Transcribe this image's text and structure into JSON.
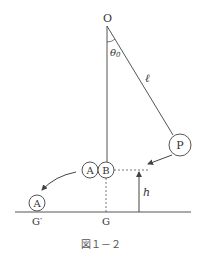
{
  "figure": {
    "caption": "図１－２",
    "colors": {
      "stroke": "#444444",
      "text": "#333333",
      "background": "#ffffff"
    }
  },
  "labels": {
    "pivot": "O",
    "angle": "θ",
    "angle_sub": "0",
    "length": "ℓ",
    "ball_p": "P",
    "ball_a": "A",
    "ball_b": "B",
    "ball_a_landed": "A",
    "height": "h",
    "ground_g": "G",
    "ground_g_prime": "G′"
  }
}
